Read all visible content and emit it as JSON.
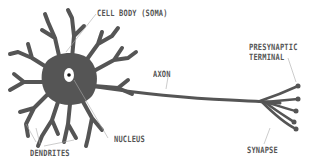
{
  "diagram": {
    "colors": {
      "cell": "#555555",
      "nucleus_fill": "#ffffff",
      "nucleolus": "#111111",
      "leader_line": "#aaaaaa",
      "label_text": "#555555",
      "background": "#ffffff"
    },
    "labels": {
      "cell_body": "CELL BODY (SOMA)",
      "axon": "AXON",
      "presynaptic_terminal_line1": "PRESYNAPTIC",
      "presynaptic_terminal_line2": "TERMINAL",
      "nucleus": "NUCLEUS",
      "dendrites": "DENDRITES",
      "synapse": "SYNAPSE"
    }
  }
}
